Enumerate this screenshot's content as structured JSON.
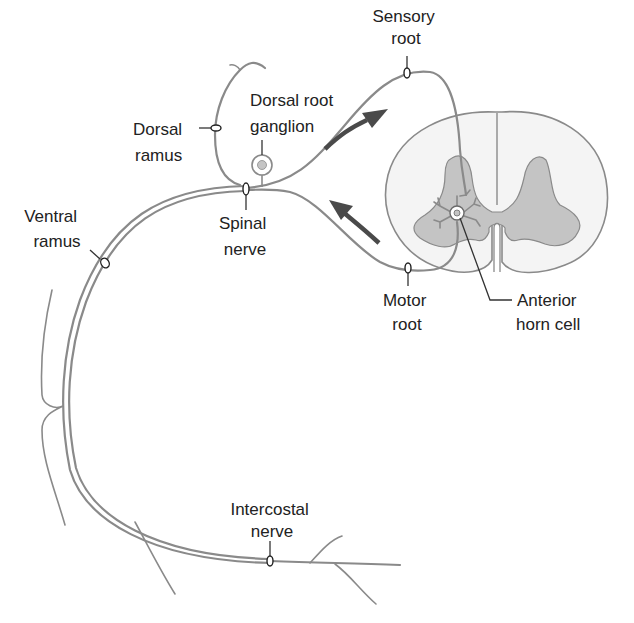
{
  "figure": {
    "colors": {
      "nerve_stroke": "#8a8a8a",
      "gray_matter": "#c4c4c4",
      "white_matter": "#f4f4f4",
      "arrow": "#4a4a4a",
      "label_text": "#222222",
      "background": "#ffffff"
    },
    "labels": {
      "sensory_root": {
        "line1": "Sensory",
        "line2": "root"
      },
      "dorsal_root_ganglion": {
        "line1": "Dorsal root",
        "line2": "ganglion"
      },
      "dorsal_ramus": {
        "line1": "Dorsal",
        "line2": "ramus"
      },
      "spinal_nerve": {
        "line1": "Spinal",
        "line2": "nerve"
      },
      "ventral_ramus": {
        "line1": "Ventral",
        "line2": "ramus"
      },
      "motor_root": {
        "line1": "Motor",
        "line2": "root"
      },
      "anterior_horn_cell": {
        "line1": "Anterior",
        "line2": "horn cell"
      },
      "intercostal_nerve": {
        "line1": "Intercostal",
        "line2": "nerve"
      }
    },
    "arrows": [
      {
        "name": "afferent-arrow",
        "direction": "toward spinal cord (sensory)"
      },
      {
        "name": "efferent-arrow",
        "direction": "away from spinal cord (motor)"
      }
    ]
  }
}
